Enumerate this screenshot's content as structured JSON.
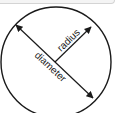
{
  "diagram": {
    "labels": {
      "radius": "radius",
      "diameter": "diameter"
    },
    "colors": {
      "stroke": "#1a1a1a",
      "background": "#ffffff"
    }
  }
}
